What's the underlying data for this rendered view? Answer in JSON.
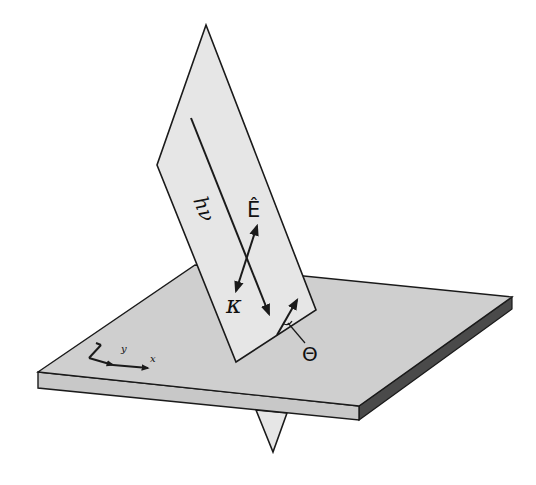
{
  "diagram": {
    "type": "3d-geometry-schematic",
    "labels": {
      "photon": "hν",
      "polarization": "Ê",
      "wavevector": "κ",
      "angle": "Θ",
      "axis_x": "x",
      "axis_y": "y"
    },
    "colors": {
      "plane_fill": "#e6e6e6",
      "slab_top": "#cfcfcf",
      "slab_front": "#c8c8c8",
      "slab_side": "#4a4a4a",
      "stroke": "#1a1a1a",
      "background": "#ffffff"
    },
    "elements": [
      {
        "name": "incidence-plane",
        "shape": "quadrilateral"
      },
      {
        "name": "sample-slab",
        "shape": "box"
      },
      {
        "name": "photon-beam",
        "shape": "arrow"
      },
      {
        "name": "polarization-vector",
        "shape": "double-arrow"
      },
      {
        "name": "emission-vector",
        "shape": "arrow"
      },
      {
        "name": "coordinate-axes",
        "shape": "axes"
      }
    ]
  }
}
